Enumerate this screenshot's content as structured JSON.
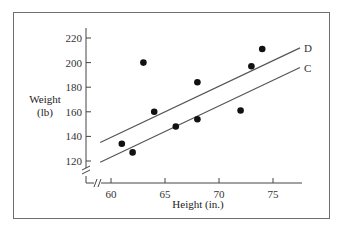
{
  "chart_data": {
    "type": "scatter",
    "title": "",
    "xlabel": "Height (in.)",
    "ylabel_line1": "Weight",
    "ylabel_line2": "(lb)",
    "xlim": [
      57.5,
      78
    ],
    "ylim": [
      103,
      228
    ],
    "x_ticks": [
      60,
      65,
      70,
      75
    ],
    "y_ticks": [
      120,
      140,
      160,
      180,
      200,
      220
    ],
    "x_tick_labels": [
      "60",
      "65",
      "70",
      "75"
    ],
    "y_tick_labels": [
      "120",
      "140",
      "160",
      "180",
      "200",
      "220"
    ],
    "axis_breaks": [
      "x",
      "y"
    ],
    "grid": false,
    "points": [
      {
        "x": 61,
        "y": 134
      },
      {
        "x": 62,
        "y": 127
      },
      {
        "x": 63,
        "y": 200
      },
      {
        "x": 64,
        "y": 160
      },
      {
        "x": 66,
        "y": 148
      },
      {
        "x": 68,
        "y": 184
      },
      {
        "x": 68,
        "y": 154
      },
      {
        "x": 72,
        "y": 161
      },
      {
        "x": 73,
        "y": 197
      },
      {
        "x": 74,
        "y": 211
      }
    ],
    "lines": [
      {
        "name": "D",
        "label": "D",
        "x0": 59,
        "y0": 135,
        "x1": 77.5,
        "y1": 212
      },
      {
        "name": "C",
        "label": "C",
        "x0": 59,
        "y0": 119,
        "x1": 77.5,
        "y1": 196
      }
    ]
  },
  "colors": {
    "frame": "#6e6e6e",
    "axis": "#444444",
    "line": "#555555",
    "point": "#111111"
  }
}
